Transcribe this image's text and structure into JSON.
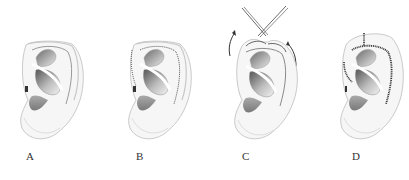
{
  "figure": {
    "panels": [
      {
        "id": "A",
        "label": "A",
        "description": "Normal ear with prominent helical rim"
      },
      {
        "id": "B",
        "label": "B",
        "description": "Dotted incision line along helical rim"
      },
      {
        "id": "C",
        "label": "C",
        "description": "Helical rim mobilized with needles/sutures and arrows showing rotation"
      },
      {
        "id": "D",
        "label": "D",
        "description": "Sutured helical rim after repair"
      }
    ],
    "colors": {
      "background": "#ffffff",
      "ear_outline": "#b8b8b8",
      "ear_fill": "#f4f4f4",
      "shadow_dark": "#6a6a6a",
      "suture": "#444444",
      "label_text": "#333333"
    }
  }
}
